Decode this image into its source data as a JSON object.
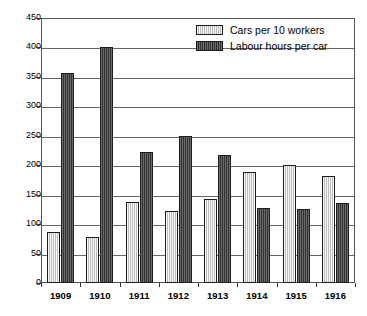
{
  "chart_data": {
    "type": "bar",
    "title": "",
    "subtitle": "",
    "xlabel": "",
    "ylabel": "",
    "ylim": [
      0,
      450
    ],
    "ytick_step": 50,
    "yticks": [
      0,
      50,
      100,
      150,
      200,
      250,
      300,
      350,
      400,
      450
    ],
    "ytick_labels": [
      "0",
      "50",
      "100",
      "150",
      "200",
      "250",
      "300",
      "350",
      "400",
      "450"
    ],
    "grid": true,
    "grid_axis": "y",
    "legend_position": "top-right",
    "categories": [
      "1909",
      "1910",
      "1911",
      "1912",
      "1913",
      "1914",
      "1915",
      "1916"
    ],
    "series": [
      {
        "name": "Cars per 10 workers",
        "color": "#d2d2d2",
        "edge_color": "#1c1c1c",
        "values": [
          87,
          78,
          138,
          122,
          142,
          189,
          200,
          181
        ]
      },
      {
        "name": "Labour hours per car",
        "color": "#4d4d4d",
        "edge_color": "#1c1c1c",
        "values": [
          357,
          400,
          223,
          250,
          218,
          128,
          125,
          136
        ]
      }
    ]
  },
  "legend": {
    "entries": [
      {
        "label": "Cars per 10 workers",
        "swatch": "light"
      },
      {
        "label": "Labour hours per car",
        "swatch": "dark"
      }
    ]
  }
}
